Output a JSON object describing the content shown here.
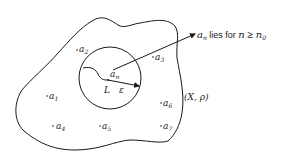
{
  "diagram": {
    "space_label": "(X, ρ)",
    "limit_label": "L",
    "epsilon_label": "ε",
    "an_label_base": "a",
    "an_label_sub": "n",
    "annotation": {
      "base": "a",
      "sub": "n",
      "text": " lies for ",
      "n": "n",
      "geq": " ≥ ",
      "n0_base": "n",
      "n0_sub": "0"
    },
    "points": [
      {
        "base": "a",
        "sub": "1"
      },
      {
        "base": "a",
        "sub": "2"
      },
      {
        "base": "a",
        "sub": "3"
      },
      {
        "base": "a",
        "sub": "4"
      },
      {
        "base": "a",
        "sub": "5"
      },
      {
        "base": "a",
        "sub": "6"
      },
      {
        "base": "a",
        "sub": "7"
      }
    ],
    "colors": {
      "ink": "#1a1a1a",
      "background": "#ffffff"
    }
  }
}
